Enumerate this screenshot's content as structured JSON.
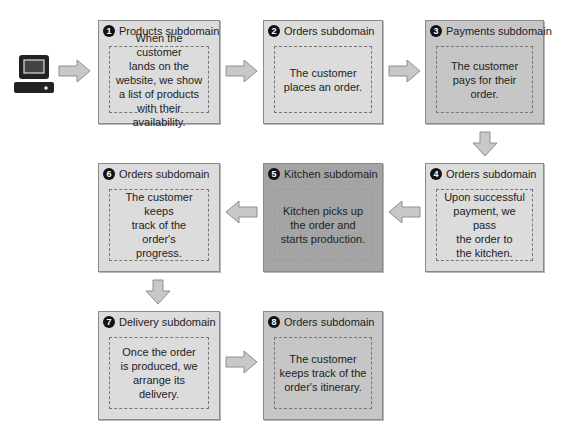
{
  "diagram": {
    "start_icon": "computer-icon",
    "colors": {
      "light_box": "#dcdcdc",
      "medium_box": "#c6c6c6",
      "dark_box": "#a4a4a4",
      "arrow_fill": "#c8c8c8",
      "badge": "#111111"
    },
    "steps": [
      {
        "number": "1",
        "title": "Products subdomain",
        "text": "When the customer\nlands on the\nwebsite, we show\na list of products\nwith their availability."
      },
      {
        "number": "2",
        "title": "Orders subdomain",
        "text": "The customer\nplaces an order."
      },
      {
        "number": "3",
        "title": "Payments subdomain",
        "text": "The customer\npays for their order."
      },
      {
        "number": "4",
        "title": "Orders subdomain",
        "text": "Upon successful\npayment, we pass\nthe order to\nthe kitchen."
      },
      {
        "number": "5",
        "title": "Kitchen subdomain",
        "text": "Kitchen picks up\nthe order and\nstarts production."
      },
      {
        "number": "6",
        "title": "Orders subdomain",
        "text": "The customer keeps\ntrack of the order's\nprogress."
      },
      {
        "number": "7",
        "title": "Delivery subdomain",
        "text": "Once the order\nis produced, we\narrange its delivery."
      },
      {
        "number": "8",
        "title": "Orders subdomain",
        "text": "The customer\nkeeps track of the\norder's itinerary."
      }
    ]
  }
}
